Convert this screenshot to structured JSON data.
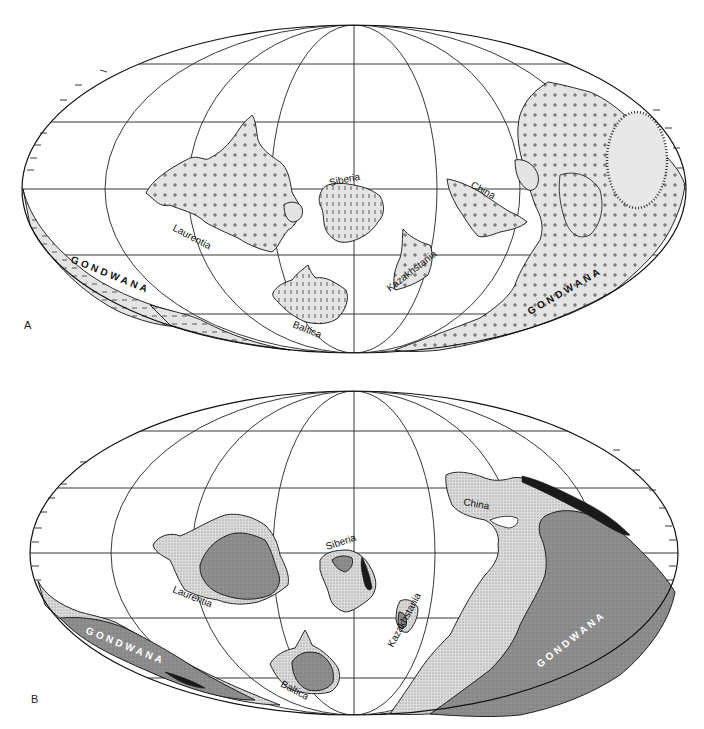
{
  "figure": {
    "type": "paleogeographic-map-pair",
    "projection": "mollweide",
    "panels": [
      {
        "id": "A",
        "label": "A",
        "colors": {
          "land": "#e4e4e4",
          "outline": "#111111",
          "graticule": "#222222",
          "background": "#ffffff"
        },
        "regions": {
          "laurentia": "Laurentia",
          "siberia": "Siberia",
          "baltica": "Baltica",
          "kazakhstania": "Kazakhstania",
          "china": "China",
          "gondwana_west": "GONDWANA",
          "gondwana_east": "GONDWANA"
        }
      },
      {
        "id": "B",
        "label": "B",
        "colors": {
          "dotted_land": "#d2d2d2",
          "dark_land": "#8a8a8a",
          "black_belt": "#1a1a1a",
          "outline": "#111111",
          "background": "#ffffff"
        },
        "regions": {
          "laurentia": "Laurentia",
          "siberia": "Siberia",
          "baltica": "Baltica",
          "kazakhstania": "Kazakhstania",
          "china": "China",
          "gondwana_west": "GONDWANA",
          "gondwana_east": "GONDWANA"
        }
      }
    ]
  }
}
